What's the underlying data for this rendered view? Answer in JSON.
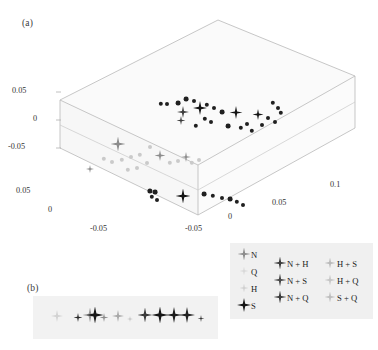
{
  "figure": {
    "panels": [
      {
        "id": "a",
        "label": "(a)"
      },
      {
        "id": "b",
        "label": "(b)"
      }
    ]
  },
  "panel_a": {
    "axis_z": {
      "ticks": [
        "0.05",
        "0",
        "-0.05"
      ]
    },
    "axis_left": {
      "ticks": [
        "0.05",
        "0",
        "-0.05"
      ]
    },
    "axis_right": {
      "ticks": [
        "-0.05",
        "0",
        "0.05",
        "0.1"
      ]
    }
  },
  "legend": {
    "columns": [
      {
        "entries": [
          {
            "label": "N",
            "color": "#8c8c8c",
            "size": 13
          },
          {
            "label": "Q",
            "color": "#d8d8d8",
            "size": 9
          },
          {
            "label": "H",
            "color": "#cfcfcf",
            "size": 9
          },
          {
            "label": "S",
            "color": "#141414",
            "size": 14
          }
        ]
      },
      {
        "entries": [
          {
            "label": "N + H",
            "color": "#3c3c3c",
            "size": 13
          },
          {
            "label": "N + S",
            "color": "#484848",
            "size": 13
          },
          {
            "label": "N + Q",
            "color": "#3a3a3a",
            "size": 13
          }
        ]
      },
      {
        "entries": [
          {
            "label": "H + S",
            "color": "#b9b9b9",
            "size": 11
          },
          {
            "label": "H + Q",
            "color": "#c4c4c4",
            "size": 11
          },
          {
            "label": "S + Q",
            "color": "#bdbdbd",
            "size": 11
          }
        ]
      }
    ]
  },
  "chart_data": {
    "type": "scatter",
    "title": "",
    "xlabel": "",
    "ylabel": "",
    "zlabel": "",
    "grid": false,
    "legend_position": "bottom-right",
    "projection": "3d-box",
    "axis_ranges": {
      "z": [
        -0.05,
        0.05
      ],
      "left": [
        -0.05,
        0.05
      ],
      "right": [
        -0.05,
        0.1
      ]
    },
    "series": [
      {
        "name": "N",
        "color": "#8c8c8c",
        "points": [
          {
            "x": 118,
            "y": 146,
            "s": 15
          },
          {
            "x": 160,
            "y": 156,
            "s": 11
          },
          {
            "x": 186,
            "y": 157,
            "s": 10
          },
          {
            "x": 90,
            "y": 168,
            "s": 8
          }
        ]
      },
      {
        "name": "S",
        "color": "#141414",
        "points": [
          {
            "x": 200,
            "y": 110,
            "s": 14
          },
          {
            "x": 183,
            "y": 198,
            "s": 15
          },
          {
            "x": 236,
            "y": 114,
            "s": 13
          },
          {
            "x": 258,
            "y": 115,
            "s": 11
          }
        ]
      },
      {
        "name": "N + H",
        "color": "#3c3c3c",
        "points": [
          {
            "x": 183,
            "y": 113,
            "s": 12
          },
          {
            "x": 181,
            "y": 120,
            "s": 9
          }
        ]
      },
      {
        "name": "scatter-dots-dark",
        "color": "#202020",
        "points": [
          {
            "x": 186,
            "y": 99,
            "s": 2.4
          },
          {
            "x": 161,
            "y": 104,
            "s": 2.2
          },
          {
            "x": 167,
            "y": 104,
            "s": 2.0
          },
          {
            "x": 178,
            "y": 103,
            "s": 2.4
          },
          {
            "x": 194,
            "y": 101,
            "s": 2.0
          },
          {
            "x": 207,
            "y": 105,
            "s": 2.2
          },
          {
            "x": 214,
            "y": 108,
            "s": 2.0
          },
          {
            "x": 222,
            "y": 112,
            "s": 2.4
          },
          {
            "x": 205,
            "y": 119,
            "s": 2.2
          },
          {
            "x": 211,
            "y": 122,
            "s": 2.0
          },
          {
            "x": 196,
            "y": 126,
            "s": 2.2
          },
          {
            "x": 228,
            "y": 126,
            "s": 2.4
          },
          {
            "x": 241,
            "y": 128,
            "s": 2.2
          },
          {
            "x": 247,
            "y": 124,
            "s": 2.0
          },
          {
            "x": 252,
            "y": 131,
            "s": 2.2
          },
          {
            "x": 262,
            "y": 125,
            "s": 2.0
          },
          {
            "x": 273,
            "y": 103,
            "s": 2.2
          },
          {
            "x": 278,
            "y": 108,
            "s": 2.0
          },
          {
            "x": 281,
            "y": 113,
            "s": 2.2
          },
          {
            "x": 268,
            "y": 118,
            "s": 2.0
          },
          {
            "x": 275,
            "y": 122,
            "s": 2.0
          },
          {
            "x": 150,
            "y": 191,
            "s": 2.6
          },
          {
            "x": 155,
            "y": 192,
            "s": 2.4
          },
          {
            "x": 152,
            "y": 197,
            "s": 2.2
          },
          {
            "x": 157,
            "y": 200,
            "s": 2.0
          },
          {
            "x": 204,
            "y": 194,
            "s": 2.4
          },
          {
            "x": 213,
            "y": 196,
            "s": 2.2
          },
          {
            "x": 222,
            "y": 198,
            "s": 2.0
          },
          {
            "x": 230,
            "y": 199,
            "s": 2.4
          },
          {
            "x": 237,
            "y": 202,
            "s": 2.2
          },
          {
            "x": 243,
            "y": 205,
            "s": 2.0
          }
        ]
      },
      {
        "name": "scatter-dots-light",
        "color": "#cacaca",
        "points": [
          {
            "x": 104,
            "y": 159,
            "s": 2.2
          },
          {
            "x": 112,
            "y": 162,
            "s": 2.0
          },
          {
            "x": 122,
            "y": 160,
            "s": 2.2
          },
          {
            "x": 131,
            "y": 157,
            "s": 2.0
          },
          {
            "x": 140,
            "y": 155,
            "s": 2.2
          },
          {
            "x": 147,
            "y": 163,
            "s": 2.0
          },
          {
            "x": 128,
            "y": 170,
            "s": 2.2
          },
          {
            "x": 137,
            "y": 168,
            "s": 2.0
          },
          {
            "x": 150,
            "y": 147,
            "s": 2.0
          },
          {
            "x": 170,
            "y": 163,
            "s": 2.2
          },
          {
            "x": 178,
            "y": 161,
            "s": 2.0
          },
          {
            "x": 192,
            "y": 163,
            "s": 2.2
          },
          {
            "x": 199,
            "y": 160,
            "s": 2.0
          }
        ]
      }
    ]
  },
  "panel_b_data": {
    "type": "scatter",
    "markers": [
      {
        "x": 24,
        "y": 21,
        "s": 12,
        "color": "#d2d2d2"
      },
      {
        "x": 45,
        "y": 21,
        "s": 9,
        "color": "#2a2a2a"
      },
      {
        "x": 57,
        "y": 21,
        "s": 15,
        "color": "#9a9a9a"
      },
      {
        "x": 62,
        "y": 21,
        "s": 17,
        "color": "#181818"
      },
      {
        "x": 71,
        "y": 21,
        "s": 9,
        "color": "#8a8a8a"
      },
      {
        "x": 85,
        "y": 21,
        "s": 12,
        "color": "#a8a8a8"
      },
      {
        "x": 97,
        "y": 21,
        "s": 6,
        "color": "#c0c0c0"
      },
      {
        "x": 112,
        "y": 21,
        "s": 15,
        "color": "#3a3a3a"
      },
      {
        "x": 127,
        "y": 21,
        "s": 17,
        "color": "#161616"
      },
      {
        "x": 141,
        "y": 21,
        "s": 16,
        "color": "#1c1c1c"
      },
      {
        "x": 154,
        "y": 21,
        "s": 16,
        "color": "#222222"
      },
      {
        "x": 168,
        "y": 21,
        "s": 7,
        "color": "#3c3c3c"
      }
    ]
  }
}
